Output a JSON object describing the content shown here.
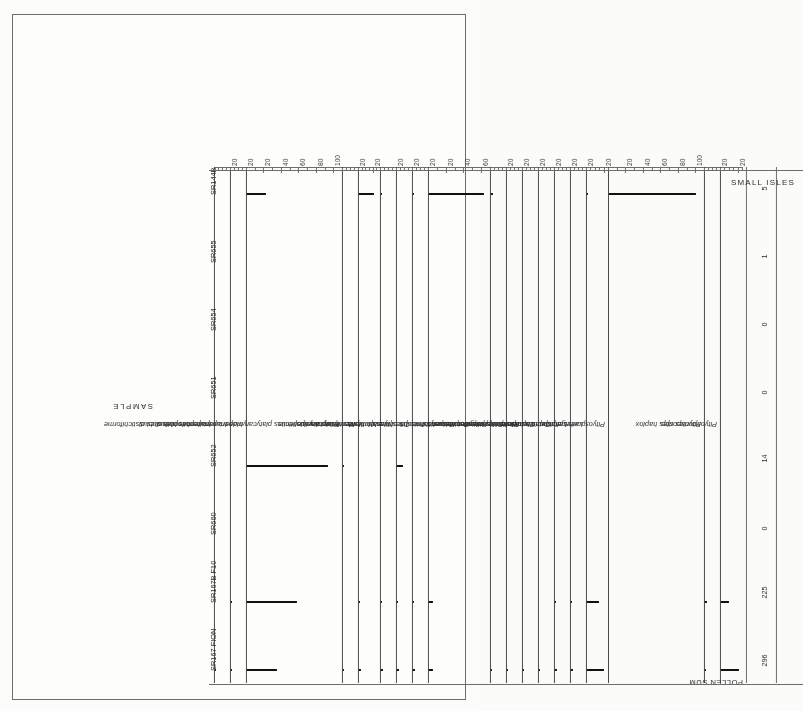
{
  "site": {
    "title": "SMALL ISLES"
  },
  "axes": {
    "sample_axis_title": "SAMPLE",
    "pollen_sum_label": "POLLEN SUM"
  },
  "samples": [
    {
      "name": "SR167 FION"
    },
    {
      "name": "SR167B F10"
    },
    {
      "name": "SR660"
    },
    {
      "name": "SR652"
    },
    {
      "name": "SR651"
    },
    {
      "name": "SR654"
    },
    {
      "name": "SR655"
    },
    {
      "name": "SR144B"
    }
  ],
  "pollen_sum": {
    "label": "POLLEN SUM",
    "values": [
      "296",
      "225",
      "0",
      "14",
      "0",
      "0",
      "1",
      "5"
    ]
  },
  "chart_data": {
    "type": "bar",
    "title": "SMALL ISLES",
    "xlabel": "SAMPLE",
    "ylabel": "percent",
    "grid": false,
    "legend": "none",
    "orientation": "pollen-diagram-rotated-180",
    "categories": [
      "SR167 FION",
      "SR167B F10",
      "SR660",
      "SR652",
      "SR651",
      "SR654",
      "SR655",
      "SR144B"
    ],
    "pollen_sum": [
      296,
      225,
      0,
      14,
      0,
      0,
      1,
      5
    ],
    "series": [
      {
        "name": "Inaperturopollenites distichiforme",
        "italic": true,
        "max": 20,
        "ticks": [
          0,
          20
        ],
        "minor": 5,
        "values": [
          1,
          0,
          0,
          0,
          0,
          0,
          0,
          0
        ]
      },
      {
        "name": "Inaperturopollenites dubius",
        "italic": true,
        "max": 20,
        "ticks": [
          0,
          20
        ],
        "minor": 5,
        "values": [
          1,
          1,
          0,
          0,
          0,
          0,
          0,
          0
        ]
      },
      {
        "name": "Inaperturopollenites hiatus",
        "italic": true,
        "max": 110,
        "ticks": [
          0,
          20,
          40,
          60,
          80,
          100
        ],
        "minor": 10,
        "values": [
          34,
          57,
          0,
          93,
          0,
          0,
          0,
          22
        ]
      },
      {
        "name": "Platycaryapollenites platycaryoides",
        "italic": true,
        "max": 20,
        "ticks": [
          0,
          20
        ],
        "minor": 5,
        "values": [
          1,
          0,
          0,
          1,
          0,
          0,
          0,
          0
        ]
      },
      {
        "name": "Momipites anellus",
        "italic": true,
        "max": 30,
        "ticks": [
          0,
          20
        ],
        "minor": 5,
        "values": [
          3,
          1,
          0,
          0,
          0,
          0,
          0,
          21
        ]
      },
      {
        "name": "Momipites tenuipolis",
        "italic": true,
        "max": 20,
        "ticks": [
          0,
          20
        ],
        "minor": 5,
        "values": [
          2,
          1,
          0,
          0,
          0,
          0,
          0,
          1
        ]
      },
      {
        "name": "Nyssapollenites kruschi analepticus",
        "italic": true,
        "max": 20,
        "ticks": [
          0,
          20
        ],
        "minor": 5,
        "values": [
          3,
          1,
          0,
          7,
          0,
          0,
          0,
          0
        ]
      },
      {
        "name": "Tricolpites cf. hians",
        "italic": true,
        "max": 20,
        "ticks": [
          0,
          20
        ],
        "minor": 5,
        "values": [
          2,
          1,
          0,
          0,
          0,
          0,
          0,
          1
        ]
      },
      {
        "name": "Tricolpites hians",
        "italic": true,
        "max": 70,
        "ticks": [
          0,
          20,
          40,
          60
        ],
        "minor": 10,
        "values": [
          4,
          5,
          0,
          0,
          0,
          0,
          0,
          62
        ]
      },
      {
        "name": "Retitricolpites retiformis",
        "italic": true,
        "max": 20,
        "ticks": [
          0,
          20
        ],
        "minor": 5,
        "values": [
          1,
          0,
          0,
          0,
          0,
          0,
          0,
          2
        ]
      },
      {
        "name": "Sequoiapollenites polyformosus",
        "italic": true,
        "max": 20,
        "ticks": [
          0,
          20
        ],
        "minor": 5,
        "values": [
          1,
          0,
          0,
          0,
          0,
          0,
          0,
          0
        ]
      },
      {
        "name": "Plicapollis pseudoexcelsus",
        "italic": true,
        "max": 20,
        "ticks": [
          0,
          20
        ],
        "minor": 5,
        "values": [
          1,
          0,
          0,
          0,
          0,
          0,
          0,
          0
        ]
      },
      {
        "name": "Cupuliferoidaepollenites liblarensis",
        "italic": true,
        "max": 20,
        "ticks": [
          0,
          20
        ],
        "minor": 5,
        "values": [
          1,
          0,
          0,
          0,
          0,
          0,
          0,
          0
        ]
      },
      {
        "name": "Cupuliferoipollenites cingulum fusus",
        "italic": true,
        "max": 20,
        "ticks": [
          0,
          20
        ],
        "minor": 5,
        "values": [
          2,
          1,
          0,
          0,
          0,
          0,
          0,
          0
        ]
      },
      {
        "name": "Leiotriletes adriennis",
        "italic": true,
        "max": 20,
        "ticks": [
          0,
          20
        ],
        "minor": 5,
        "values": [
          2,
          1,
          0,
          0,
          0,
          0,
          0,
          0
        ]
      },
      {
        "name": "Laevigatosporites haardti",
        "italic": true,
        "max": 25,
        "ticks": [
          0,
          20
        ],
        "minor": 5,
        "values": [
          19,
          14,
          0,
          0,
          0,
          0,
          0,
          1
        ]
      },
      {
        "name": "Pityosporites diplox",
        "italic": true,
        "max": 110,
        "ticks": [
          0,
          20,
          40,
          60,
          80,
          100
        ],
        "minor": 10,
        "values": [
          0,
          0,
          0,
          0,
          0,
          0,
          0,
          100
        ]
      },
      {
        "name": "Pityosporites haplox",
        "italic": true,
        "max": 20,
        "ticks": [
          0,
          20
        ],
        "minor": 5,
        "values": [
          1,
          2,
          0,
          0,
          0,
          0,
          0,
          0
        ]
      },
      {
        "name": "Pityosporites spp.",
        "italic": true,
        "max": 25,
        "ticks": [
          0,
          20
        ],
        "minor": 5,
        "values": [
          21,
          9,
          0,
          0,
          0,
          0,
          0,
          0
        ]
      }
    ]
  }
}
